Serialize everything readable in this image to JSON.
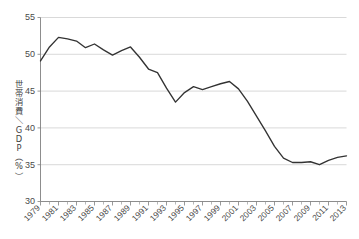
{
  "chart_data": {
    "type": "line",
    "title": "",
    "xlabel": "",
    "ylabel": "世帯消費／GDP（%）",
    "ylabel_chars": [
      "世",
      "帯",
      "消",
      "費",
      "／",
      "G",
      "D",
      "P",
      "（",
      "%",
      "）"
    ],
    "ylim": [
      30,
      55
    ],
    "xlim": [
      1979,
      2013
    ],
    "yticks": [
      30,
      35,
      40,
      45,
      50,
      55
    ],
    "ytick_labels": [
      "30",
      "35",
      "40",
      "45",
      "50",
      "55"
    ],
    "xtick_labels": [
      "1979",
      "1981",
      "1983",
      "1985",
      "1987",
      "1989",
      "1991",
      "1993",
      "1995",
      "1997",
      "1999",
      "2001",
      "2003",
      "2005",
      "2007",
      "2009",
      "2011",
      "2013"
    ],
    "grid": true,
    "grid_axis": "y",
    "legend": null,
    "line_color": "#333333",
    "grid_color": "#c9c9c9",
    "axis_color": "#808080",
    "x": [
      1979,
      1980,
      1981,
      1982,
      1983,
      1984,
      1985,
      1986,
      1987,
      1988,
      1989,
      1990,
      1991,
      1992,
      1993,
      1994,
      1995,
      1996,
      1997,
      1998,
      1999,
      2000,
      2001,
      2002,
      2003,
      2004,
      2005,
      2006,
      2007,
      2008,
      2009,
      2010,
      2011,
      2012,
      2013
    ],
    "values": [
      49.1,
      51.0,
      52.3,
      52.1,
      51.8,
      50.9,
      51.4,
      50.6,
      49.9,
      50.5,
      51.0,
      49.6,
      48.0,
      47.5,
      45.4,
      43.5,
      44.8,
      45.6,
      45.2,
      45.6,
      46.0,
      46.3,
      45.3,
      43.6,
      41.6,
      39.6,
      37.5,
      35.9,
      35.3,
      35.3,
      35.4,
      35.0,
      35.6,
      36.0,
      36.2
    ],
    "series": [
      {
        "name": "世帯消費／GDP",
        "values": [
          49.1,
          51.0,
          52.3,
          52.1,
          51.8,
          50.9,
          51.4,
          50.6,
          49.9,
          50.5,
          51.0,
          49.6,
          48.0,
          47.5,
          45.4,
          43.5,
          44.8,
          45.6,
          45.2,
          45.6,
          46.0,
          46.3,
          45.3,
          43.6,
          41.6,
          39.6,
          37.5,
          35.9,
          35.3,
          35.3,
          35.4,
          35.0,
          35.6,
          36.0,
          36.2
        ]
      }
    ]
  }
}
